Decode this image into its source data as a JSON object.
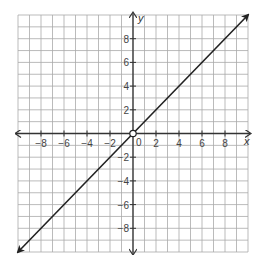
{
  "chart_data": {
    "type": "line",
    "title": "",
    "xlabel": "x",
    "ylabel": "y",
    "xlim": [
      -10,
      10
    ],
    "ylim": [
      -10,
      10
    ],
    "grid": true,
    "x_ticks": [
      -8,
      -6,
      -4,
      -2,
      0,
      2,
      4,
      6,
      8
    ],
    "y_ticks": [
      8,
      6,
      4,
      2,
      -2,
      -4,
      -6,
      -8
    ],
    "x_tick_labels": [
      "-8",
      "-6",
      "-4",
      "-2",
      "0",
      "2",
      "4",
      "6",
      "8"
    ],
    "y_tick_labels": [
      "8",
      "6",
      "4",
      "2",
      "-2",
      "-4",
      "-6",
      "-8"
    ],
    "series": [
      {
        "name": "y = x",
        "x": [
          -10,
          10
        ],
        "y": [
          -10,
          10
        ],
        "arrows": "both",
        "open_point": [
          0,
          0
        ]
      }
    ],
    "legend": null
  },
  "colors": {
    "grid": "#aaaaaa",
    "axis": "#333333",
    "line": "#222222",
    "background": "#ffffff"
  }
}
